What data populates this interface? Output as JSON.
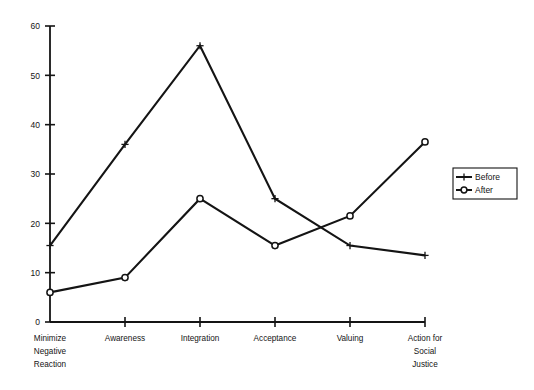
{
  "chart_data": {
    "type": "line",
    "title": "",
    "xlabel": "",
    "ylabel": "",
    "categories": [
      "Minimize\nNegative\nReaction",
      "Awareness",
      "Integration",
      "Acceptance",
      "Valuing",
      "Action for\nSocial\nJustice"
    ],
    "category_lines": [
      [
        "Minimize",
        "Negative",
        "Reaction"
      ],
      [
        "Awareness"
      ],
      [
        "Integration"
      ],
      [
        "Acceptance"
      ],
      [
        "Valuing"
      ],
      [
        "Action for",
        "Social",
        "Justice"
      ]
    ],
    "series": [
      {
        "name": "Before",
        "marker": "plus",
        "values": [
          15.5,
          36,
          56,
          25,
          15.5,
          13.5
        ]
      },
      {
        "name": "After",
        "marker": "circle",
        "values": [
          6,
          9,
          25,
          15.5,
          21.5,
          36.5
        ]
      }
    ],
    "ylim": [
      0,
      60
    ],
    "yticks": [
      0,
      10,
      20,
      30,
      40,
      50,
      60
    ],
    "ytick_labels": [
      "0",
      "10",
      "20",
      "30",
      "40",
      "50",
      "60"
    ],
    "grid": false,
    "legend_position": "right",
    "line_color": "#141414"
  },
  "legend": {
    "entries": [
      {
        "label": "Before",
        "marker": "plus-marker-icon"
      },
      {
        "label": "After",
        "marker": "circle-marker-icon"
      }
    ]
  }
}
